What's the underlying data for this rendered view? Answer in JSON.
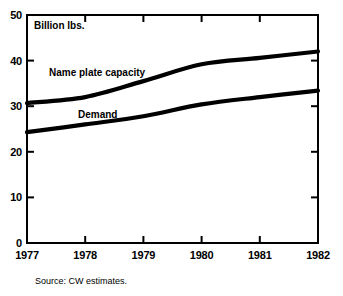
{
  "chart_data": {
    "type": "line",
    "title": "",
    "subtitle": "",
    "xlabel": "",
    "ylabel": "Billion lbs.",
    "unit_label": "Billion lbs.",
    "categories": [
      "1977",
      "1978",
      "1979",
      "1980",
      "1981",
      "1982"
    ],
    "x": [
      1977,
      1978,
      1979,
      1980,
      1981,
      1982
    ],
    "xlim": [
      1977,
      1982
    ],
    "ylim": [
      0,
      50
    ],
    "ytick_values": [
      0,
      10,
      20,
      30,
      40,
      50
    ],
    "ytick_labels": [
      "0",
      "10",
      "20",
      "30",
      "40",
      "50"
    ],
    "xtick_labels": [
      "1977",
      "1978",
      "1979",
      "1980",
      "1981",
      "1982"
    ],
    "grid": false,
    "legend_position": "inline-annotation",
    "series": [
      {
        "name": "Name plate capacity",
        "label": "Name plate capacity",
        "color": "#000000",
        "values": [
          30.7,
          32.0,
          35.5,
          39.2,
          40.6,
          42.0
        ]
      },
      {
        "name": "Demand",
        "label": "Demand",
        "color": "#000000",
        "values": [
          24.3,
          26.0,
          27.8,
          30.4,
          32.0,
          33.4
        ]
      }
    ],
    "annotations": [
      {
        "text": "Name plate capacity",
        "series": "Name plate capacity"
      },
      {
        "text": "Demand",
        "series": "Demand"
      }
    ],
    "source": "Source: CW estimates."
  },
  "figure": {
    "unit_label": "Billion lbs.",
    "source": "Source: CW estimates.",
    "capacity_label": "Name plate capacity",
    "demand_label": "Demand",
    "ytick_0": "0",
    "ytick_1": "10",
    "ytick_2": "20",
    "ytick_3": "30",
    "ytick_4": "40",
    "ytick_5": "50",
    "xtick_0": "1977",
    "xtick_1": "1978",
    "xtick_2": "1979",
    "xtick_3": "1980",
    "xtick_4": "1981",
    "xtick_5": "1982"
  },
  "colors": {
    "ink": "#000000",
    "background": "#ffffff"
  }
}
